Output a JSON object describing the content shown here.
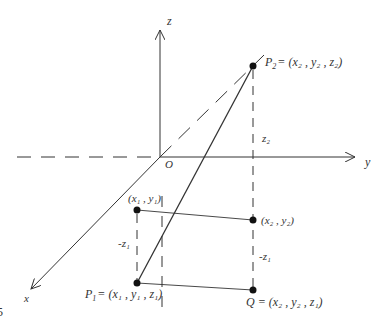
{
  "diagram": {
    "title": "",
    "figure_number_fragment": "5",
    "axes": {
      "x_label": "x",
      "y_label": "y",
      "z_label": "z",
      "origin_label": "O"
    },
    "points": {
      "p2": {
        "name": "P",
        "sub": "2",
        "coords": "= (x₂ , y₂ , z₂)"
      },
      "p1": {
        "name": "P",
        "sub": "1",
        "coords": "= (x₁ , y₁ , z₁)"
      },
      "q": {
        "name": "Q",
        "coords": "= (x₂ , y₂ , z₁)"
      },
      "proj1": {
        "coords": "(x₁ , y₁)"
      },
      "proj2": {
        "coords": "(x₂ , y₂)"
      }
    },
    "segment_labels": {
      "z2": "z₂",
      "neg_z1_left": "-z₁",
      "neg_z1_right": "-z₁"
    },
    "colors": {
      "stroke": "#333333",
      "background": "#ffffff"
    }
  }
}
